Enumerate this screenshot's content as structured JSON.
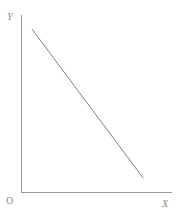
{
  "chart_data": {
    "type": "line",
    "title": "",
    "subtitle": "",
    "xlabel": "X",
    "ylabel": "Y",
    "origin_label": "O",
    "grid": false,
    "legend": null,
    "xlim": [
      0,
      1
    ],
    "ylim": [
      0,
      1
    ],
    "xticks": [],
    "yticks": [],
    "xticklabels": [],
    "yticklabels": [],
    "annotations": [],
    "series": [
      {
        "name": "",
        "x": [
          0.07,
          0.81
        ],
        "y": [
          0.92,
          0.08
        ],
        "style": "solid",
        "color": "#808080"
      }
    ]
  },
  "figure": {
    "background_color": "#ffffff",
    "axis_color": "#9a9a9a",
    "line_color": "#808080",
    "label_color": "#8a8a8a"
  },
  "labels": {
    "y": "Y",
    "x": "X",
    "origin": "O"
  }
}
